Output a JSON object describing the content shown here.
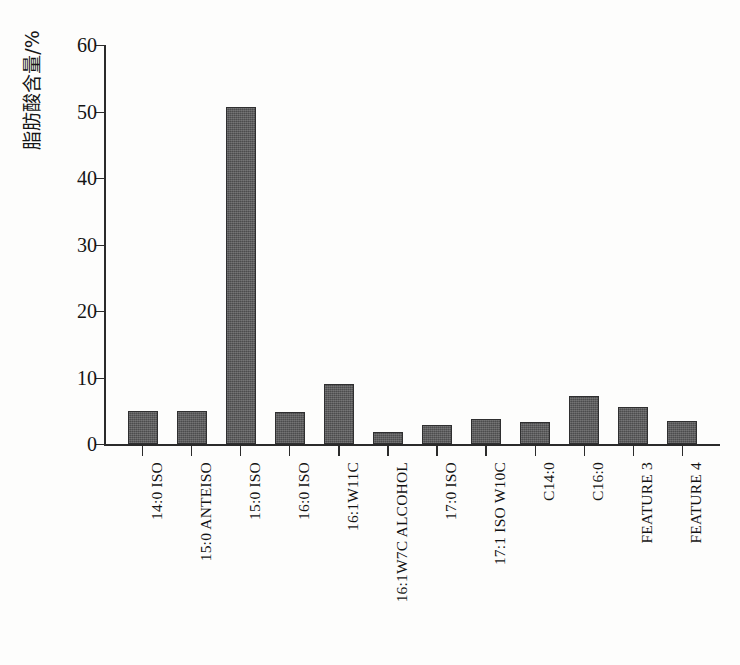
{
  "figure": {
    "background_color": "#fdfdfc",
    "bar_color": "#59595a",
    "axis_color": "#2b2b2b"
  },
  "chart_data": {
    "type": "bar",
    "title": "",
    "xlabel": "",
    "ylabel": "脂肪酸含量/%",
    "ylim": [
      0,
      60
    ],
    "yticks": [
      0,
      10,
      20,
      30,
      40,
      50,
      60
    ],
    "ytick_labels": [
      "0",
      "10",
      "20",
      "30",
      "40",
      "50",
      "60"
    ],
    "grid": false,
    "legend": false,
    "categories": [
      "14:0 ISO",
      "15:0 ANTEISO",
      "15:0 ISO",
      "16:0 ISO",
      "16:1W11C",
      "16:1W7C ALCOHOL",
      "17:0 ISO",
      "17:1 ISO W10C",
      "C14:0",
      "C16:0",
      "FEATURE 3",
      "FEATURE 4"
    ],
    "values": [
      5.0,
      4.9,
      50.7,
      4.8,
      9.1,
      1.8,
      2.8,
      3.8,
      3.3,
      7.2,
      5.5,
      3.4
    ]
  }
}
